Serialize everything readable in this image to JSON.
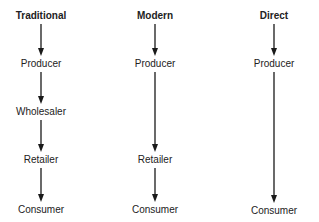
{
  "columns": [
    {
      "title": "Traditional",
      "x": 41,
      "nodes": [
        {
          "label": "Producer",
          "y": 64
        },
        {
          "label": "Wholesaler",
          "y": 112
        },
        {
          "label": "Retailer",
          "y": 160
        },
        {
          "label": "Consumer",
          "y": 210
        }
      ]
    },
    {
      "title": "Modern",
      "x": 155,
      "nodes": [
        {
          "label": "Producer",
          "y": 64
        },
        {
          "label": "Retailer",
          "y": 160
        },
        {
          "label": "Consumer",
          "y": 210
        }
      ]
    },
    {
      "title": "Direct",
      "x": 274,
      "nodes": [
        {
          "label": "Producer",
          "y": 64
        },
        {
          "label": "Consumer",
          "y": 211
        }
      ]
    }
  ],
  "title_y": 16,
  "line_color": "#1a1a1a"
}
